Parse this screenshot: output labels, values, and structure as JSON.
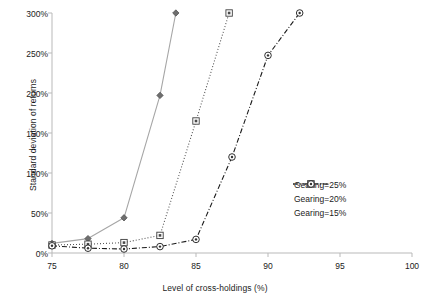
{
  "chart_data": {
    "type": "line",
    "title": "",
    "xlabel": "Level of cross-holdings (%)",
    "ylabel": "Standard deviation of returns",
    "xlim": [
      75,
      100
    ],
    "ylim": [
      0,
      300
    ],
    "xticks": [
      "75",
      "80",
      "85",
      "90",
      "95",
      "100"
    ],
    "yticks": [
      "0%",
      "50%",
      "100%",
      "150%",
      "200%",
      "250%",
      "300%"
    ],
    "grid": false,
    "legend_position": "right-middle",
    "series": [
      {
        "name": "Gearing=25%",
        "marker": "diamond",
        "line_style": "solid",
        "color": "#a6a6a6",
        "x": [
          75,
          77.5,
          80,
          82.5,
          83.6
        ],
        "y": [
          12,
          18,
          44,
          197,
          300
        ]
      },
      {
        "name": "Gearing=20%",
        "marker": "square",
        "line_style": "dotted",
        "color": "#555555",
        "x": [
          75,
          77.5,
          80,
          82.5,
          85,
          87.3
        ],
        "y": [
          10,
          11,
          13,
          22,
          165,
          300
        ]
      },
      {
        "name": "Gearing=15%",
        "marker": "circle",
        "line_style": "dash-dot",
        "color": "#1a1a1a",
        "x": [
          75,
          77.5,
          80,
          82.5,
          85,
          87.5,
          90,
          92.2
        ],
        "y": [
          9,
          6,
          5,
          8,
          17,
          120,
          247,
          300
        ]
      }
    ]
  },
  "legend": {
    "items": [
      {
        "label": "Gearing=25%"
      },
      {
        "label": "Gearing=20%"
      },
      {
        "label": "Gearing=15%"
      }
    ]
  }
}
